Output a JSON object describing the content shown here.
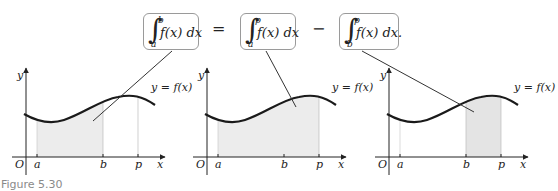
{
  "equation": {
    "terms": [
      {
        "lower": "a",
        "upper": "b",
        "integrand": "f(x) dx"
      },
      {
        "lower": "a",
        "upper": "p",
        "integrand": "f(x) dx"
      },
      {
        "lower": "b",
        "upper": "p",
        "integrand": "f(x) dx."
      }
    ],
    "operators": [
      "=",
      "−"
    ]
  },
  "panels": [
    {
      "shaded_from": "a",
      "shaded_to": "b"
    },
    {
      "shaded_from": "a",
      "shaded_to": "p"
    },
    {
      "shaded_from": "b",
      "shaded_to": "p"
    }
  ],
  "axis_labels": {
    "origin": "O",
    "x": "x",
    "y": "y",
    "a": "a",
    "b": "b",
    "p": "p"
  },
  "curve_label": "y = f(x)",
  "caption": "Figure 5.30",
  "colors": {
    "shade": "#ececec",
    "curve": "#1a1a1a",
    "box_border": "#9a9a9a",
    "caption": "#8a8a8a"
  }
}
